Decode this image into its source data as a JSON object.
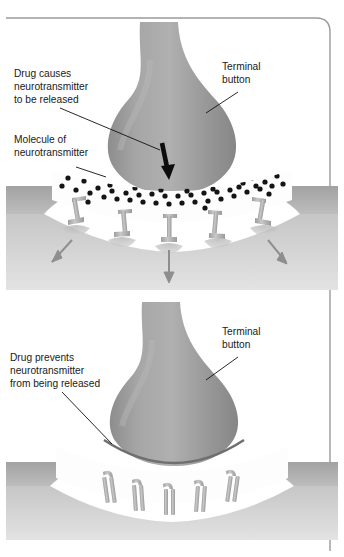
{
  "figure": {
    "frame": {
      "border_color": "#9a9a9a",
      "corner_radius": 14,
      "top_rule": true,
      "right_rule": true
    },
    "palette": {
      "terminal_button_fill": "#9b9b9b",
      "terminal_button_shade": "#8a8a8a",
      "terminal_button_highlight": "#b4b4b4",
      "postsynaptic_top_band": "#a8a8a8",
      "postsynaptic_body": "#c9c9c9",
      "postsynaptic_deep": "#d8d8d8",
      "cleft_fill": "#fdfdfd",
      "receptor_fill": "#b9b9b9",
      "receptor_stroke": "#8c8c8c",
      "neurotransmitter_dot": "#141414",
      "release_arrow": "#0d0d0d",
      "flow_arrow": "#8e8e8e",
      "leader_line": "#111111",
      "barrier_line": "#6f6f6f",
      "text": "#1a1a1a",
      "background": "#ffffff"
    }
  },
  "panels": [
    {
      "id": "top-panel",
      "name": "drug-causes-release-panel",
      "labels": [
        {
          "id": "drug-causes-release-label",
          "lines": [
            "Drug causes",
            "neurotransmitter",
            "to be released"
          ],
          "x": 14,
          "y": 70,
          "leader": {
            "from_x": 60,
            "from_y": 108,
            "to_x": 160,
            "to_y": 152
          }
        },
        {
          "id": "molecule-of-neurotransmitter-label",
          "lines": [
            "Molecule of",
            "neurotransmitter"
          ],
          "x": 14,
          "y": 136,
          "leader": {
            "from_x": 76,
            "from_y": 167,
            "to_x": 105,
            "to_y": 176
          }
        },
        {
          "id": "terminal-button-label-top",
          "lines": [
            "Terminal",
            "button"
          ],
          "x": 222,
          "y": 63,
          "leader": {
            "from_x": 238,
            "from_y": 92,
            "to_x": 206,
            "to_y": 113
          }
        }
      ],
      "release_arrow": {
        "x": 165,
        "y_top": 143,
        "y_bottom": 178
      },
      "neurotransmitter_count": 52,
      "receptor_count": 5,
      "flow_arrows": 3
    },
    {
      "id": "bottom-panel",
      "name": "drug-prevents-release-panel",
      "labels": [
        {
          "id": "drug-prevents-release-label",
          "lines": [
            "Drug prevents",
            "neurotransmitter",
            "from being released"
          ],
          "x": 10,
          "y": 354,
          "leader": {
            "from_x": 62,
            "from_y": 392,
            "to_x": 112,
            "to_y": 442
          }
        },
        {
          "id": "terminal-button-label-bottom",
          "lines": [
            "Terminal",
            "button"
          ],
          "x": 222,
          "y": 328,
          "leader": {
            "from_x": 238,
            "from_y": 357,
            "to_x": 206,
            "to_y": 380
          }
        }
      ],
      "neurotransmitter_count": 0,
      "receptor_count": 5,
      "flow_arrows": 0,
      "barrier_arc": true
    }
  ]
}
